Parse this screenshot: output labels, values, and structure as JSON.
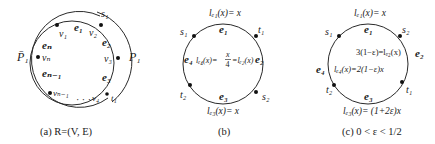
{
  "panels": [
    {
      "id": "a",
      "caption": "(a)  R=(V, E)",
      "vertices": [
        "v1",
        "v2",
        "v3",
        "v4",
        "vn-1",
        "vn"
      ],
      "vertex_labels": {
        "v1": "v₁",
        "v2": "v₂",
        "v3": "v₃",
        "v4": "v₄",
        "vn_1": "vₙ₋₁",
        "vn": "vₙ"
      },
      "edge_labels": {
        "e1": "e₁",
        "e2": "e₂",
        "e3": "e₃",
        "en": "eₙ",
        "en_1": "eₙ₋₁"
      },
      "ellipsis": "· · ·",
      "path_labels": {
        "s": "s₁",
        "t": "t₁",
        "P": "P₁",
        "Pbar": "P̄₁"
      }
    },
    {
      "id": "b",
      "caption": "(b)",
      "terminals": {
        "s1": "s₁",
        "t1": "t₁",
        "s2": "s₂",
        "t2": "t₂"
      },
      "edge_labels": {
        "e1": "e₁",
        "e2": "e₂",
        "e3": "e₃",
        "e4": "e₄"
      },
      "latencies": {
        "top": "lₑ₁(x)= x",
        "bottom": "lₑ₃(x)= x",
        "middle_left": "lₑ₄(x)=",
        "middle_frac_num": "x",
        "middle_frac_den": "4",
        "middle_right": "=lₑ₂(x)"
      }
    },
    {
      "id": "c",
      "caption": "(c)  0 < ε < 1/2",
      "terminals": {
        "s1": "s₁",
        "s2": "s₂",
        "t1": "t₁",
        "t2": "t₂"
      },
      "edge_labels": {
        "e1": "e₁",
        "e2": "e₂",
        "e3": "e₃",
        "e4": "e₄"
      },
      "latencies": {
        "top": "lₑ₁(x)= x",
        "right": "3(1−ε)=lₑ₂(x)",
        "left": "lₑ₄(x)=2(1−ε)x",
        "bottom": "lₑ₃(x)= (1+2ε)x"
      }
    }
  ],
  "colors": {
    "stroke": "#2a2a2a",
    "text": "#1a1a1a",
    "background": "#ffffff"
  }
}
